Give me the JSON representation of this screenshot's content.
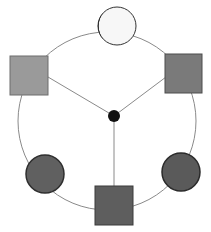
{
  "diagram": {
    "type": "network",
    "colors": {
      "background": "#ffffff",
      "edge": "#8a8a8a",
      "hub": "#111111",
      "node_white": "#f7f7f7",
      "node_light_gray": "#9a9a9a",
      "node_mid_gray": "#7a7a7a",
      "node_dark_gray": "#5a5a5a"
    },
    "hub": {
      "id": "center",
      "shape": "circle",
      "fill": "#111111"
    },
    "nodes": [
      {
        "id": "top",
        "shape": "circle",
        "fill": "#f7f7f7"
      },
      {
        "id": "upper-right",
        "shape": "square",
        "fill": "#7a7a7a"
      },
      {
        "id": "lower-right",
        "shape": "circle",
        "fill": "#5a5a5a"
      },
      {
        "id": "bottom",
        "shape": "square",
        "fill": "#5e5e5e"
      },
      {
        "id": "lower-left",
        "shape": "circle",
        "fill": "#606060"
      },
      {
        "id": "upper-left",
        "shape": "square",
        "fill": "#9a9a9a"
      }
    ],
    "spokes": [
      "upper-left",
      "upper-right",
      "bottom"
    ]
  }
}
